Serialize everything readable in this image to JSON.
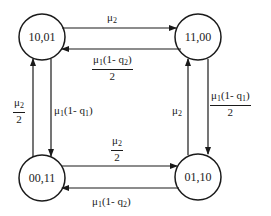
{
  "diagram": {
    "type": "state-transition",
    "states": [
      {
        "id": "s1",
        "label": "10,01",
        "position": "top-left"
      },
      {
        "id": "s2",
        "label": "11,00",
        "position": "top-right"
      },
      {
        "id": "s3",
        "label": "00,11",
        "position": "bottom-left"
      },
      {
        "id": "s4",
        "label": "01,10",
        "position": "bottom-right"
      }
    ],
    "edges": [
      {
        "from": "10,01",
        "to": "11,00",
        "rate": "μ2",
        "num_main": "μ",
        "num_sub": "2",
        "den": ""
      },
      {
        "from": "11,00",
        "to": "10,01",
        "rate": "μ1(1-q2)/2",
        "num_main": "μ",
        "num_sub": "1",
        "num_tail": "(1- q",
        "num_tail_sub": "2",
        "num_end": ")",
        "den": "2"
      },
      {
        "from": "00,11",
        "to": "10,01",
        "rate": "μ2/2",
        "num_main": "μ",
        "num_sub": "2",
        "den": "2"
      },
      {
        "from": "10,01",
        "to": "00,11",
        "rate": "μ1(1-q1)",
        "num_main": "μ",
        "num_sub": "1",
        "num_tail": "(1- q",
        "num_tail_sub": "1",
        "num_end": ")",
        "den": ""
      },
      {
        "from": "01,10",
        "to": "11,00",
        "rate": "μ2",
        "num_main": "μ",
        "num_sub": "2",
        "den": ""
      },
      {
        "from": "11,00",
        "to": "01,10",
        "rate": "μ1(1-q1)/2",
        "num_main": "μ",
        "num_sub": "1",
        "num_tail": "(1- q",
        "num_tail_sub": "1",
        "num_end": ")",
        "den": "2"
      },
      {
        "from": "00,11",
        "to": "01,10",
        "rate": "μ2/2",
        "num_main": "μ",
        "num_sub": "2",
        "den": "2"
      },
      {
        "from": "01,10",
        "to": "00,11",
        "rate": "μ1(1-q2)",
        "num_main": "μ",
        "num_sub": "1",
        "num_tail": "(1- q",
        "num_tail_sub": "2",
        "num_end": ")",
        "den": ""
      }
    ],
    "colors": {
      "stroke": "#1a1a1a",
      "background": "#ffffff"
    }
  }
}
